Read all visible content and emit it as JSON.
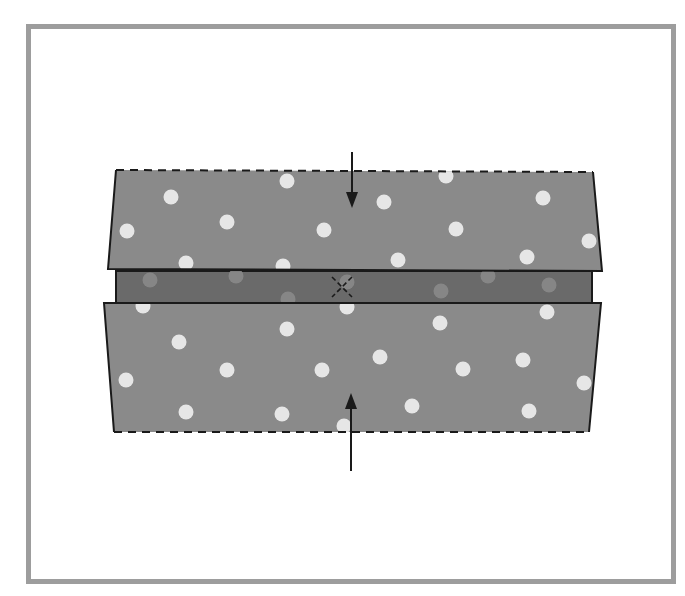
{
  "diagram": {
    "type": "folding-instruction",
    "colors": {
      "frame": "#9d9d9d",
      "background": "#ffffff",
      "fabric": "#8a8a8a",
      "fabric_underside": "#6a6a6a",
      "dot": "#e6e6e6",
      "outline": "#1a1a1a"
    },
    "panels": [
      {
        "name": "top-fold",
        "edge_style": "dashed-top",
        "points": [
          [
            116,
            170
          ],
          [
            593,
            172
          ],
          [
            602,
            271
          ],
          [
            108,
            269
          ]
        ]
      },
      {
        "name": "center-strip",
        "edge_style": "solid",
        "points": [
          [
            116,
            271
          ],
          [
            592,
            271
          ],
          [
            592,
            303
          ],
          [
            116,
            303
          ]
        ]
      },
      {
        "name": "bottom-fold",
        "edge_style": "dashed-bottom",
        "points": [
          [
            104,
            303
          ],
          [
            601,
            303
          ],
          [
            589,
            432
          ],
          [
            114,
            432
          ]
        ]
      }
    ],
    "center_mark": {
      "symbol": "dashed-x",
      "x": 342,
      "y": 287
    },
    "arrows": [
      {
        "name": "arrow-down",
        "direction": "down",
        "x": 352,
        "y1": 152,
        "y2": 208
      },
      {
        "name": "arrow-up",
        "direction": "up",
        "x": 351,
        "y1": 471,
        "y2": 393
      }
    ],
    "dots_top": [
      [
        287,
        181
      ],
      [
        171,
        197
      ],
      [
        384,
        202
      ],
      [
        543,
        198
      ],
      [
        446,
        176
      ],
      [
        227,
        222
      ],
      [
        324,
        230
      ],
      [
        456,
        229
      ],
      [
        127,
        231
      ],
      [
        589,
        241
      ],
      [
        186,
        263
      ],
      [
        283,
        266
      ],
      [
        398,
        260
      ],
      [
        527,
        257
      ]
    ],
    "dots_middle_faint": [
      [
        150,
        280
      ],
      [
        236,
        276
      ],
      [
        347,
        282
      ],
      [
        441,
        291
      ],
      [
        488,
        276
      ],
      [
        549,
        285
      ],
      [
        288,
        299
      ]
    ],
    "dots_bottom": [
      [
        143,
        306
      ],
      [
        347,
        307
      ],
      [
        547,
        312
      ],
      [
        440,
        323
      ],
      [
        287,
        329
      ],
      [
        179,
        342
      ],
      [
        380,
        357
      ],
      [
        523,
        360
      ],
      [
        227,
        370
      ],
      [
        322,
        370
      ],
      [
        463,
        369
      ],
      [
        126,
        380
      ],
      [
        584,
        383
      ],
      [
        186,
        412
      ],
      [
        282,
        414
      ],
      [
        412,
        406
      ],
      [
        529,
        411
      ],
      [
        344,
        426
      ]
    ]
  }
}
